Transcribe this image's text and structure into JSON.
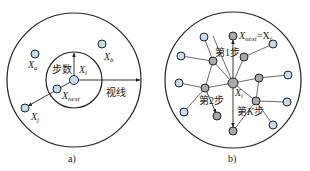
{
  "panel_a": {
    "caption": "a)",
    "labels": {
      "xa": "X",
      "xa_sub": "a",
      "xb": "X",
      "xb_sub": "b",
      "xi": "X",
      "xi_sub": "i",
      "xnext": "X",
      "xnext_sub": "next",
      "xj": "X",
      "xj_sub": "j",
      "step": "步数",
      "vision": "视线"
    }
  },
  "panel_b": {
    "caption": "b)",
    "labels": {
      "xnext": "X",
      "xnext_sub": "next",
      "eq": "=X",
      "eq_sub": "j",
      "xi": "X",
      "xi_sub": "i",
      "step1": "第1步",
      "step2": "第2步",
      "stepk_pre": "第",
      "stepk_k": "K",
      "stepk_post": "步"
    }
  },
  "colors": {
    "blue_node": "#c4dcee",
    "gray_node": "#a9a9a9",
    "stroke": "#222222"
  }
}
